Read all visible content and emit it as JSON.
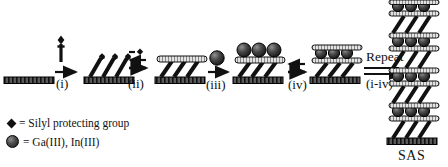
{
  "figure": {
    "title_label": "SAS",
    "type": "reaction-scheme"
  },
  "steps": [
    {
      "id": "i",
      "label": "(i)"
    },
    {
      "id": "ii",
      "label": "(ii)"
    },
    {
      "id": "iii",
      "label": "(iii)"
    },
    {
      "id": "iv",
      "label": "(iv)"
    }
  ],
  "reagents": {
    "step_ii_label": "-",
    "repeat_word": "Repeat",
    "repeat_steps": "(i-iv)"
  },
  "legend": {
    "items": [
      {
        "symbol": "diamond-icon",
        "equals": "=",
        "text": "= Silyl protecting group"
      },
      {
        "symbol": "sphere-icon",
        "equals": "=",
        "text": "= Ga(III), In(III)"
      }
    ]
  },
  "colors": {
    "ink": "#111111",
    "substrate_fill": "#4d4d4d",
    "sphere_dark": "#1d1d1d",
    "sphere_light": "#8d8d8d",
    "plate_fill": "#d9d9d9"
  }
}
